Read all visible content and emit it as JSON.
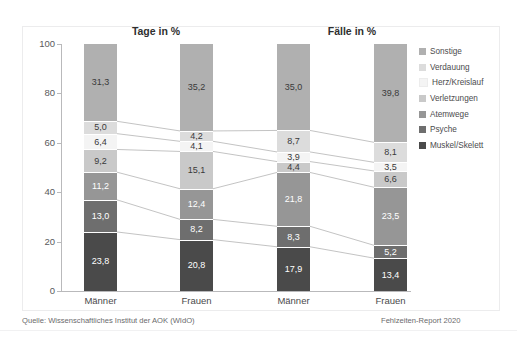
{
  "figure": {
    "titles": {
      "left": "Tage in %",
      "right": "Fälle in %"
    },
    "y_axis": {
      "ticks": [
        "0",
        "20",
        "40",
        "60",
        "80",
        "100"
      ],
      "min": 0,
      "max": 100
    },
    "x_labels": [
      "Männer",
      "Frauen",
      "Männer",
      "Frauen"
    ],
    "footer": {
      "source": "Quelle: Wissenschaftliches Institut der AOK (WIdO)",
      "report": "Fehlzeiten-Report 2020"
    }
  },
  "legend": {
    "items": [
      {
        "label": "Sonstige",
        "color": "#b0b0b0"
      },
      {
        "label": "Verdauung",
        "color": "#dcdcdc"
      },
      {
        "label": "Herz/Kreislauf",
        "color": "#f4f4f4"
      },
      {
        "label": "Verletzungen",
        "color": "#c9c9c9"
      },
      {
        "label": "Atemwege",
        "color": "#969696"
      },
      {
        "label": "Psyche",
        "color": "#6e6e6e"
      },
      {
        "label": "Muskel/Skelett",
        "color": "#4a4a4a"
      }
    ]
  },
  "chart_data": {
    "type": "bar",
    "subtitle": "",
    "xlabel": "",
    "ylabel": "",
    "ylim": [
      0,
      100
    ],
    "yticks": [
      0,
      20,
      40,
      60,
      80,
      100
    ],
    "grid": false,
    "stacked": true,
    "legend_position": "right",
    "panels": [
      "Tage in %",
      "Fälle in %"
    ],
    "categories": [
      "Männer (Tage)",
      "Frauen (Tage)",
      "Männer (Fälle)",
      "Frauen (Fälle)"
    ],
    "category_labels": [
      "Männer",
      "Frauen",
      "Männer",
      "Frauen"
    ],
    "series": [
      {
        "name": "Sonstige",
        "color": "#b0b0b0",
        "values": [
          31.3,
          35.2,
          35.0,
          39.8
        ],
        "labels": [
          "31,3",
          "35,2",
          "35,0",
          "39,8"
        ]
      },
      {
        "name": "Verdauung",
        "color": "#dcdcdc",
        "values": [
          5.0,
          4.2,
          8.7,
          8.1
        ],
        "labels": [
          "5,0",
          "4,2",
          "8,7",
          "8,1"
        ]
      },
      {
        "name": "Herz/Kreislauf",
        "color": "#f4f4f4",
        "values": [
          6.4,
          4.1,
          3.9,
          3.5
        ],
        "labels": [
          "6,4",
          "4,1",
          "3,9",
          "3,5"
        ]
      },
      {
        "name": "Verletzungen",
        "color": "#c9c9c9",
        "values": [
          9.2,
          15.1,
          4.4,
          6.6
        ],
        "labels": [
          "9,2",
          "15,1",
          "4,4",
          "6,6"
        ]
      },
      {
        "name": "Atemwege",
        "color": "#969696",
        "values": [
          11.2,
          12.4,
          21.8,
          23.5
        ],
        "labels": [
          "11,2",
          "12,4",
          "21,8",
          "23,5"
        ]
      },
      {
        "name": "Psyche",
        "color": "#6e6e6e",
        "values": [
          13.0,
          8.2,
          8.3,
          5.2
        ],
        "labels": [
          "13,0",
          "8,2",
          "8,3",
          "5,2"
        ]
      },
      {
        "name": "Muskel/Skelett",
        "color": "#4a4a4a",
        "values": [
          23.8,
          20.8,
          17.9,
          13.4
        ],
        "labels": [
          "23,8",
          "20,8",
          "17,9",
          "13,4"
        ]
      }
    ],
    "stack_order_top_to_bottom": [
      "Sonstige",
      "Verdauung",
      "Herz/Kreislauf",
      "Verletzungen",
      "Atemwege",
      "Psyche",
      "Muskel/Skelett"
    ],
    "connectors": true,
    "connector_color": "#9a9a9a"
  }
}
